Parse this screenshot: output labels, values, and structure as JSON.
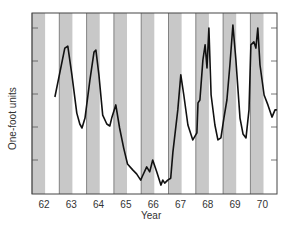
{
  "chart_data": {
    "type": "line",
    "title": "",
    "xlabel": "Year",
    "ylabel": "One-foot units",
    "x_tick_labels": [
      "62",
      "63",
      "64",
      "65",
      "66",
      "67",
      "68",
      "69",
      "70"
    ],
    "y_tick_labels": [],
    "y_ticks_count": 5,
    "xlim": [
      1962,
      1970.95
    ],
    "ylim": [
      0,
      5.5
    ],
    "grid": false,
    "legend": null,
    "shaded_bands": {
      "description": "Alternating gray bands covering the first ~half of each year",
      "color": "#c8c8c8",
      "years": [
        62,
        63,
        64,
        65,
        66,
        67,
        68,
        69,
        70
      ],
      "fraction_of_year": 0.48
    },
    "series": [
      {
        "name": "Water level",
        "color": "#111111",
        "points": [
          [
            62.84,
            2.94
          ],
          [
            63.2,
            4.42
          ],
          [
            63.31,
            4.48
          ],
          [
            63.46,
            3.61
          ],
          [
            63.64,
            2.45
          ],
          [
            63.75,
            2.12
          ],
          [
            63.83,
            2.0
          ],
          [
            63.94,
            2.3
          ],
          [
            64.12,
            3.45
          ],
          [
            64.27,
            4.3
          ],
          [
            64.34,
            4.36
          ],
          [
            64.45,
            3.61
          ],
          [
            64.59,
            2.39
          ],
          [
            64.74,
            2.12
          ],
          [
            64.85,
            2.06
          ],
          [
            64.92,
            2.3
          ],
          [
            65.07,
            2.7
          ],
          [
            65.21,
            2.0
          ],
          [
            65.36,
            1.39
          ],
          [
            65.5,
            0.91
          ],
          [
            65.69,
            0.73
          ],
          [
            65.83,
            0.61
          ],
          [
            65.98,
            0.42
          ],
          [
            66.05,
            0.55
          ],
          [
            66.2,
            0.82
          ],
          [
            66.31,
            0.67
          ],
          [
            66.42,
            1.03
          ],
          [
            66.57,
            0.67
          ],
          [
            66.72,
            0.27
          ],
          [
            66.79,
            0.42
          ],
          [
            66.86,
            0.33
          ],
          [
            66.97,
            0.42
          ],
          [
            67.08,
            0.48
          ],
          [
            67.16,
            1.27
          ],
          [
            67.34,
            2.55
          ],
          [
            67.45,
            3.61
          ],
          [
            67.56,
            3.0
          ],
          [
            67.71,
            2.09
          ],
          [
            67.89,
            1.64
          ],
          [
            68.04,
            1.85
          ],
          [
            68.08,
            2.76
          ],
          [
            68.15,
            2.85
          ],
          [
            68.26,
            4.06
          ],
          [
            68.34,
            4.52
          ],
          [
            68.41,
            3.82
          ],
          [
            68.48,
            5.03
          ],
          [
            68.56,
            3.0
          ],
          [
            68.7,
            2.09
          ],
          [
            68.81,
            1.64
          ],
          [
            68.92,
            1.7
          ],
          [
            69.03,
            2.3
          ],
          [
            69.14,
            2.85
          ],
          [
            69.25,
            3.91
          ],
          [
            69.36,
            5.12
          ],
          [
            69.47,
            4.06
          ],
          [
            69.62,
            2.3
          ],
          [
            69.73,
            1.82
          ],
          [
            69.84,
            1.7
          ],
          [
            69.95,
            2.55
          ],
          [
            70.02,
            4.52
          ],
          [
            70.13,
            4.61
          ],
          [
            70.2,
            4.42
          ],
          [
            70.27,
            5.03
          ],
          [
            70.35,
            3.91
          ],
          [
            70.5,
            3.0
          ],
          [
            70.64,
            2.7
          ],
          [
            70.79,
            2.33
          ],
          [
            70.9,
            2.55
          ],
          [
            70.97,
            2.55
          ]
        ]
      }
    ]
  }
}
